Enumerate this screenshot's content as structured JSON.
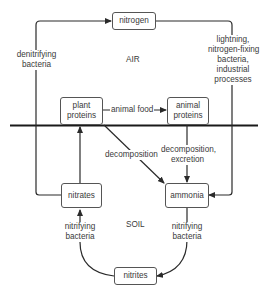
{
  "regions": {
    "air": "AIR",
    "soil": "SOIL"
  },
  "nodes": {
    "nitrogen": "nitrogen",
    "plant_proteins": [
      "plant",
      "proteins"
    ],
    "animal_proteins": [
      "animal",
      "proteins"
    ],
    "nitrates": "nitrates",
    "ammonia": "ammonia",
    "nitrites": "nitrites"
  },
  "edges": {
    "denitrifying": [
      "denitrifying",
      "bacteria"
    ],
    "fixation": [
      "lightning,",
      "nitrogen-fixing",
      "bacteria,",
      "industrial",
      "processes"
    ],
    "animal_food": "animal food",
    "decomposition": "decomposition",
    "decomposition_excretion": [
      "decomposition,",
      "excretion"
    ],
    "nitrifying_left": [
      "nitrifying",
      "bacteria"
    ],
    "nitrifying_right": [
      "nitrifying",
      "bacteria"
    ]
  },
  "colors": {
    "line": "#2a2a2a",
    "ground": "#1a1a1a",
    "text": "#3a3a3a"
  }
}
